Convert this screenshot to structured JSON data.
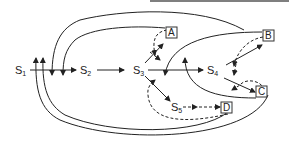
{
  "diagram": {
    "states": [
      {
        "id": "S1",
        "label": "S",
        "sub": "1"
      },
      {
        "id": "S2",
        "label": "S",
        "sub": "2"
      },
      {
        "id": "S3",
        "label": "S",
        "sub": "3"
      },
      {
        "id": "S4",
        "label": "S",
        "sub": "4"
      },
      {
        "id": "S5",
        "label": "S",
        "sub": "5"
      }
    ],
    "boxes": [
      {
        "id": "A",
        "label": "A"
      },
      {
        "id": "B",
        "label": "B"
      },
      {
        "id": "C",
        "label": "C"
      },
      {
        "id": "D",
        "label": "D"
      }
    ],
    "edges": [
      {
        "from": "S1",
        "to": "S2",
        "style": "solid"
      },
      {
        "from": "S2",
        "to": "S3",
        "style": "solid"
      },
      {
        "from": "S3",
        "to": "A",
        "style": "solid"
      },
      {
        "from": "S3",
        "to": "S4",
        "style": "solid"
      },
      {
        "from": "S3",
        "to": "S5",
        "style": "solid"
      },
      {
        "from": "S4",
        "to": "B",
        "style": "solid"
      },
      {
        "from": "S4",
        "to": "C",
        "style": "solid"
      },
      {
        "from": "S5",
        "to": "D",
        "style": "dashed"
      },
      {
        "from": "A",
        "to": "S3",
        "style": "dashed"
      },
      {
        "from": "B",
        "to": "S4",
        "style": "dashed"
      },
      {
        "from": "C",
        "to": "S4",
        "style": "dashed"
      },
      {
        "from": "D",
        "to": "S3",
        "style": "dashed"
      },
      {
        "from": "B",
        "to": "S1",
        "style": "solid"
      },
      {
        "from": "A",
        "to": "S1",
        "style": "solid"
      },
      {
        "from": "C",
        "to": "S1",
        "style": "solid"
      },
      {
        "from": "D",
        "to": "S1",
        "style": "solid"
      },
      {
        "from": "B",
        "to": "S3",
        "style": "solid"
      },
      {
        "from": "C",
        "to": "S3",
        "style": "solid"
      }
    ]
  }
}
